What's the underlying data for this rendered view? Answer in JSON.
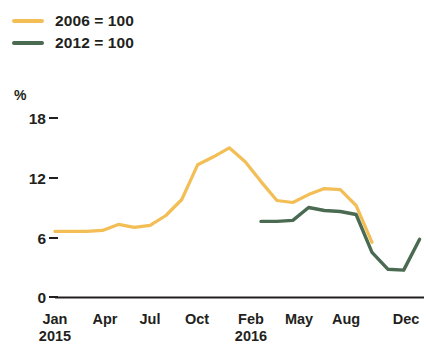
{
  "chart_data": {
    "type": "line",
    "title": "",
    "subtitle": "",
    "xlabel": "",
    "ylabel": "%",
    "ylim": [
      0,
      18
    ],
    "yticks": [
      0,
      6,
      12,
      18
    ],
    "ytick_labels": [
      "0",
      "6",
      "12",
      "18"
    ],
    "xtick_labels": [
      "Jan",
      "Apr",
      "Jul",
      "Oct",
      "Feb",
      "May",
      "Aug",
      "Dec"
    ],
    "xtick_years": [
      "2015",
      "",
      "",
      "",
      "2016",
      "",
      "",
      ""
    ],
    "grid": false,
    "legend_position": "top-left",
    "x": [
      "2015-01",
      "2015-02",
      "2015-03",
      "2015-04",
      "2015-05",
      "2015-06",
      "2015-07",
      "2015-08",
      "2015-09",
      "2015-10",
      "2015-11",
      "2015-12",
      "2016-01",
      "2016-02",
      "2016-03",
      "2016-04",
      "2016-05",
      "2016-06",
      "2016-07",
      "2016-08",
      "2016-09",
      "2016-10",
      "2016-11",
      "2016-12"
    ],
    "series": [
      {
        "name": "2006 = 100",
        "color": "#F2BE55",
        "values": [
          6.6,
          6.6,
          6.6,
          6.7,
          7.3,
          7.0,
          7.2,
          8.2,
          9.8,
          13.3,
          14.1,
          15.0,
          13.6,
          11.6,
          9.7,
          9.5,
          10.3,
          10.9,
          10.8,
          9.2,
          5.5,
          null,
          null,
          null
        ]
      },
      {
        "name": "2012 = 100",
        "color": "#4A6B52",
        "values": [
          null,
          null,
          null,
          null,
          null,
          null,
          null,
          null,
          null,
          null,
          null,
          null,
          null,
          7.6,
          7.6,
          7.7,
          9.0,
          8.7,
          8.6,
          8.3,
          4.5,
          2.8,
          2.7,
          5.8
        ]
      }
    ]
  },
  "legend": {
    "items": [
      {
        "label": "2006 = 100",
        "color": "#F2BE55"
      },
      {
        "label": "2012 = 100",
        "color": "#4A6B52"
      }
    ]
  },
  "axes": {
    "unit": "%",
    "y_labels": [
      "18",
      "12",
      "6",
      "0"
    ],
    "x_labels": [
      {
        "month": "Jan",
        "year": "2015"
      },
      {
        "month": "Apr",
        "year": ""
      },
      {
        "month": "Jul",
        "year": ""
      },
      {
        "month": "Oct",
        "year": ""
      },
      {
        "month": "Feb",
        "year": "2016"
      },
      {
        "month": "May",
        "year": ""
      },
      {
        "month": "Aug",
        "year": ""
      },
      {
        "month": "Dec",
        "year": ""
      }
    ]
  }
}
